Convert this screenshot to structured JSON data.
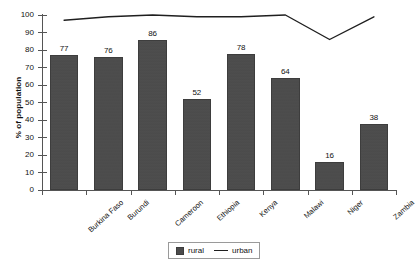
{
  "chart_data": {
    "type": "bar",
    "title": "",
    "xlabel": "",
    "ylabel": "% of population",
    "ylim": [
      0,
      100
    ],
    "ytick_step": 10,
    "grid": false,
    "legend_position": "bottom-center",
    "categories": [
      "Burkina Faso",
      "Burundi",
      "Cameroon",
      "Ethiopia",
      "Kenya",
      "Malawi",
      "Niger",
      "Zambia"
    ],
    "series": [
      {
        "name": "rural",
        "type": "bar",
        "color": "#4b4b4b",
        "values": [
          77,
          76,
          86,
          52,
          78,
          64,
          16,
          38
        ],
        "data_labels": [
          "77",
          "76",
          "86",
          "52",
          "78",
          "64",
          "16",
          "38"
        ]
      },
      {
        "name": "urban",
        "type": "line",
        "color": "#1f1f1f",
        "values": [
          97,
          99,
          100,
          99,
          99,
          100,
          86,
          99
        ],
        "data_labels": []
      }
    ],
    "ytick_labels": [
      "0",
      "10",
      "20",
      "30",
      "40",
      "50",
      "60",
      "70",
      "80",
      "90",
      "100"
    ]
  },
  "axis": {
    "y_title": "% of population"
  },
  "legend": {
    "items": [
      {
        "label": "rural",
        "marker": "square-swatch"
      },
      {
        "label": "urban",
        "marker": "line-marker"
      }
    ]
  }
}
